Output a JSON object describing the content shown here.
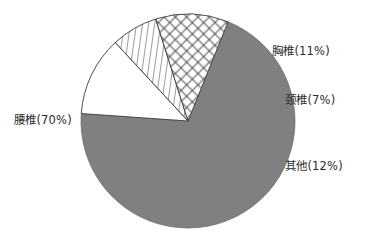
{
  "chart_data": {
    "type": "pie",
    "title": "",
    "subtitle": "",
    "xlabel": "",
    "ylabel": "",
    "legend_position": "none",
    "grid": false,
    "labels_inline": true,
    "total": 100,
    "unit": "%",
    "categories": [
      "腰椎",
      "胸椎",
      "颈椎",
      "其他"
    ],
    "values": [
      70,
      11,
      7,
      12
    ],
    "start_angle_deg": 22,
    "direction": "clockwise",
    "slices": [
      {
        "name": "腰椎",
        "value": 70,
        "label": "腰椎(70%)",
        "fill": "#808080",
        "pattern": "solid-gray"
      },
      {
        "name": "胸椎",
        "value": 11,
        "label": "胸椎(11%)",
        "fill": "#ffffff",
        "pattern": "cross-hatch"
      },
      {
        "name": "颈椎",
        "value": 7,
        "label": "颈椎(7%)",
        "fill": "#ffffff",
        "pattern": "vertical-hatch"
      },
      {
        "name": "其他",
        "value": 12,
        "label": "其他(12%)",
        "fill": "#ffffff",
        "pattern": "none"
      }
    ],
    "colors": {
      "background": "#ffffff",
      "gray_slice": "#808080",
      "outline": "#3a3a3a",
      "text": "#2b2b2b"
    }
  }
}
